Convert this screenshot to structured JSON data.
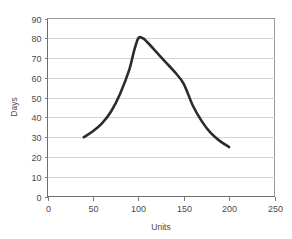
{
  "chart_data": {
    "type": "line",
    "title": "",
    "subtitle": "",
    "xlabel": "Units",
    "ylabel": "Days",
    "xlim": [
      0,
      250
    ],
    "ylim": [
      0,
      90
    ],
    "xticks": [
      0,
      50,
      100,
      150,
      200,
      250
    ],
    "yticks": [
      0,
      10,
      20,
      30,
      40,
      50,
      60,
      70,
      80,
      90
    ],
    "xtick_labels": [
      "0",
      "50",
      "100",
      "150",
      "200",
      "250"
    ],
    "ytick_labels": [
      "0",
      "10",
      "20",
      "30",
      "40",
      "50",
      "60",
      "70",
      "80",
      "90"
    ],
    "grid": {
      "horizontal": true,
      "vertical": false,
      "color": "#c9c9c9"
    },
    "legend": {
      "visible": false,
      "position": "none",
      "entries": []
    },
    "annotations": [],
    "series": [
      {
        "name": "Days vs Units",
        "color": "#2b2b2b",
        "line_width": 2.6,
        "markers": false,
        "smoothing": "spline",
        "x": [
          40,
          50,
          60,
          70,
          80,
          90,
          95,
          100,
          105,
          110,
          120,
          130,
          140,
          150,
          160,
          170,
          180,
          190,
          200
        ],
        "y": [
          30,
          33,
          37,
          43,
          52,
          64,
          73,
          80,
          80,
          78,
          73,
          68,
          63,
          57,
          46,
          38,
          32,
          28,
          25
        ]
      }
    ],
    "key_points": {
      "start": {
        "x": 40,
        "y": 30
      },
      "peak": {
        "x": 100,
        "y": 80
      },
      "end": {
        "x": 200,
        "y": 25
      }
    }
  },
  "axes": {
    "y_axis_title": "Days",
    "x_axis_title": "Units"
  },
  "colors": {
    "background": "#ffffff",
    "plot_background": "#ffffff",
    "gridline": "#c9c9c9",
    "border": "#9a9a9a",
    "axis": "#6f6f6f",
    "text": "#4a4a4a",
    "series": "#2b2b2b"
  }
}
